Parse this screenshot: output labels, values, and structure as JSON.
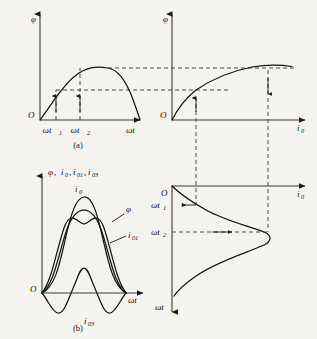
{
  "figure": {
    "background_color": "#f4f3f0",
    "ink_color": "#14120d",
    "panels": [
      {
        "id": "a",
        "caption": "(a)",
        "position": "top-left",
        "y_axis_label": "φ",
        "x_axis_label": "ωt",
        "origin_label": "O",
        "x_ticks": [
          {
            "label": "ωt",
            "sub": "1"
          },
          {
            "label": "ωt",
            "sub": "2"
          }
        ],
        "description": "Sinusoidal flux half-wave versus time with vertical projectors at ωt1 and ωt2"
      },
      {
        "id": "b",
        "caption": "",
        "position": "top-right",
        "y_axis_label": "φ",
        "x_axis_label": "i",
        "x_axis_label_sub": "0",
        "origin_label": "O",
        "description": "Saturating magnetization curve φ versus exciting current i0"
      },
      {
        "id": "c",
        "caption": "(b)",
        "position": "bottom-left",
        "y_axis_label": "φ, i₀,i₀₁,i₀₃",
        "x_axis_label": "ωt",
        "origin_label": "O",
        "curves": [
          {
            "name": "i",
            "sub": "0",
            "role": "total exciting current, peaked"
          },
          {
            "name": "φ",
            "sub": "",
            "role": "flux, sinusoidal"
          },
          {
            "name": "i",
            "sub": "01",
            "role": "fundamental component"
          },
          {
            "name": "i",
            "sub": "03",
            "role": "third harmonic component"
          }
        ],
        "description": "Exciting current waveform resolved into fundamental and third harmonic"
      },
      {
        "id": "d",
        "caption": "",
        "position": "bottom-right",
        "y_axis_label": "ωt",
        "x_axis_label": "i",
        "x_axis_label_sub": "0",
        "origin_label": "O",
        "y_ticks": [
          {
            "label": "ωt",
            "sub": "1"
          },
          {
            "label": "ωt",
            "sub": "2"
          }
        ],
        "description": "Exciting current plotted against time with the time axis directed downward"
      }
    ],
    "axis_label_flux": "φ",
    "axis_label_current": "i",
    "axis_label_time": "ωt",
    "subscript_zero": "0",
    "subscript_one": "1",
    "subscript_two": "2",
    "subscript_zero_one": "01",
    "subscript_zero_three": "03",
    "label_composite_b": ",",
    "captions": {
      "a": "(a)",
      "b": "(b)"
    }
  }
}
